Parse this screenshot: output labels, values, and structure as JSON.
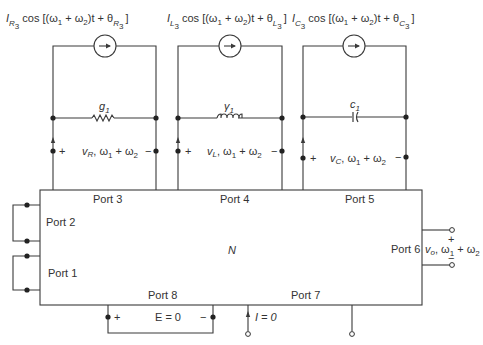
{
  "diagram": {
    "network_label": "N",
    "colors": {
      "line": "#3a3a3a",
      "text": "#333333",
      "background": "#ffffff"
    },
    "branches": [
      {
        "id": "R",
        "source_label": {
          "amp": "I",
          "amp_sub": "R",
          "amp_sub2": "3",
          "cos": "cos [(ω",
          "w1": "1",
          "plus": " + ω",
          "w2": "2",
          "t": ")t + θ",
          "ph_sub": "R",
          "ph_sub2": "3",
          "close": "]"
        },
        "element_label": "g",
        "element_sub": "1",
        "element_type": "resistor",
        "voltage_label": {
          "v": "v",
          "v_sub": "R",
          "freq": ", ω",
          "w1": "1",
          "plus": " + ω",
          "w2": "2"
        },
        "plus": "+",
        "minus": "−",
        "port_label": "Port 3"
      },
      {
        "id": "L",
        "source_label": {
          "amp": "I",
          "amp_sub": "L",
          "amp_sub2": "3",
          "cos": "cos [(ω",
          "w1": "1",
          "plus": " + ω",
          "w2": "2",
          "t": ")t + θ",
          "ph_sub": "L",
          "ph_sub2": "3",
          "close": "]"
        },
        "element_label": "γ",
        "element_sub": "1",
        "element_type": "inductor",
        "voltage_label": {
          "v": "v",
          "v_sub": "L",
          "freq": ", ω",
          "w1": "1",
          "plus": " + ω",
          "w2": "2"
        },
        "plus": "+",
        "minus": "−",
        "port_label": "Port 4"
      },
      {
        "id": "C",
        "source_label": {
          "amp": "I",
          "amp_sub": "C",
          "amp_sub2": "3",
          "cos": "cos [(ω",
          "w1": "1",
          "plus": " + ω",
          "w2": "2",
          "t": ")t + θ",
          "ph_sub": "C",
          "ph_sub2": "3",
          "close": "]"
        },
        "element_label": "c",
        "element_sub": "1",
        "element_type": "capacitor",
        "voltage_label": {
          "v": "v",
          "v_sub": "C",
          "freq": ", ω",
          "w1": "1",
          "plus": " + ω",
          "w2": "2"
        },
        "plus": "+",
        "minus": "−",
        "port_label": "Port 5"
      }
    ],
    "ports": {
      "port1": "Port 1",
      "port2": "Port 2",
      "port6": "Port 6",
      "port7": "Port 7",
      "port8": "Port 8"
    },
    "output": {
      "v": "v",
      "v_sub": "o",
      "freq": ", ω",
      "w1": "1",
      "plus": " + ω",
      "w2": "2",
      "plus_sign": "+",
      "minus_sign": "−"
    },
    "port8_source": {
      "label": "E = 0",
      "plus": "+",
      "minus": "−"
    },
    "port7_current": {
      "label": "I = 0"
    }
  }
}
